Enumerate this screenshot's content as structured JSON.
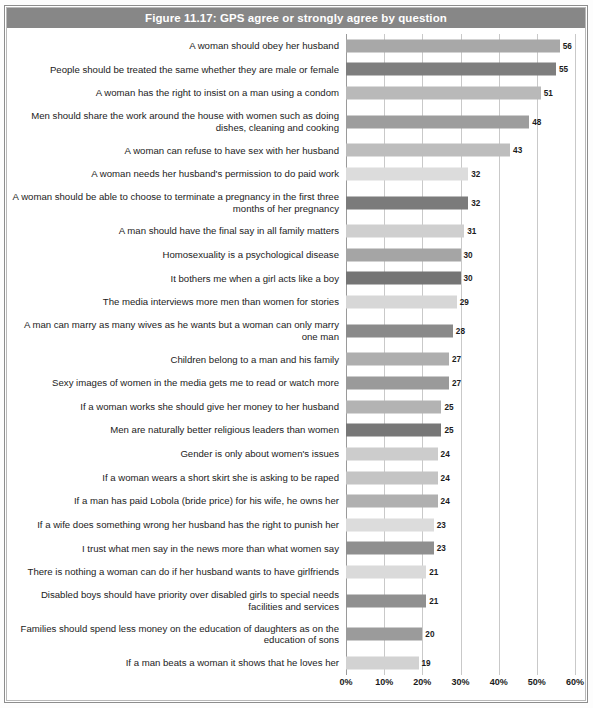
{
  "figure": {
    "title": "Figure 11.17: GPS agree or strongly agree by question",
    "title_band_color": "#878787",
    "frame_color": "#8d8d8d",
    "background": "#ffffff"
  },
  "chart_data": {
    "type": "bar",
    "orientation": "horizontal",
    "title": "Figure 11.17: GPS agree or strongly agree by question",
    "xlabel": "",
    "ylabel": "",
    "xlim": [
      0,
      60
    ],
    "grid": true,
    "legend": "none",
    "xticks": [
      0,
      10,
      20,
      30,
      40,
      50,
      60
    ],
    "xtick_labels": [
      "0%",
      "10%",
      "20%",
      "30%",
      "40%",
      "50%",
      "60%"
    ],
    "value_suffix": "",
    "categories": [
      "A woman should obey her husband",
      "People should be treated the same whether they are male or female",
      "A woman has the right to insist on a man using a condom",
      "Men should share the work around the house with women such as doing dishes, cleaning and cooking",
      "A woman can refuse to have sex with her husband",
      "A woman needs her husband's permission to do paid work",
      "A woman should be able to choose to terminate a pregnancy in the first three months of her pregnancy",
      "A man should have the final say in all family matters",
      "Homosexuality is a psychological disease",
      "It bothers me when a girl acts like a boy",
      "The media interviews more men than women for stories",
      "A man can marry as many wives as he wants but a woman can only marry one man",
      "Children belong to a man and his family",
      "Sexy images of women in the media gets me to read or watch more",
      "If a woman works she should give her money to her husband",
      "Men are naturally better religious leaders than women",
      "Gender is only about women's issues",
      "If a woman wears a short skirt she is asking to be raped",
      "If a man has paid Lobola (bride price) for his wife, he owns her",
      "If a wife does something wrong her husband has the right to punish her",
      "I trust what men say in the news more than what women say",
      "There is nothing a woman can do if her husband wants to have girlfriends",
      "Disabled boys should have priority over disabled girls to special needs facilities and services",
      "Families should spend less money on the education of daughters as on the education of sons",
      "If a man beats a woman it shows that he loves her"
    ],
    "values": [
      56,
      55,
      51,
      48,
      43,
      32,
      32,
      31,
      30,
      30,
      29,
      28,
      27,
      27,
      25,
      25,
      24,
      24,
      24,
      23,
      23,
      21,
      21,
      20,
      19
    ],
    "bar_colors": [
      "#a8a8a8",
      "#7e7e7e",
      "#b9b9b9",
      "#9d9d9d",
      "#bdbdbd",
      "#dcdcdc",
      "#7b7b7b",
      "#cfcfcf",
      "#a5a5a5",
      "#757575",
      "#d7d7d7",
      "#8a8a8a",
      "#aeaeae",
      "#9a9a9a",
      "#b3b3b3",
      "#777777",
      "#cccccc",
      "#c4c4c4",
      "#b0b0b0",
      "#dcdcdc",
      "#8f8f8f",
      "#dadada",
      "#909090",
      "#9b9b9b",
      "#d2d2d2"
    ],
    "row_line_counts": [
      1,
      1,
      1,
      2,
      1,
      1,
      2,
      1,
      1,
      1,
      1,
      2,
      1,
      1,
      1,
      1,
      1,
      1,
      1,
      1,
      1,
      1,
      2,
      2,
      1
    ]
  }
}
